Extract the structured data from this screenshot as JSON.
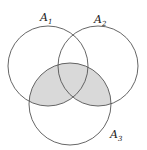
{
  "diagram": {
    "type": "venn",
    "sets": [
      {
        "name": "A",
        "sub": "1",
        "cx": 48,
        "cy": 66,
        "r": 40
      },
      {
        "name": "A",
        "sub": "2",
        "cx": 98,
        "cy": 66,
        "r": 40
      },
      {
        "name": "A",
        "sub": "3",
        "cx": 70,
        "cy": 104,
        "r": 41
      }
    ],
    "shaded_region": "A3 ∩ (A1 ∪ A2)",
    "colors": {
      "stroke": "#555555",
      "shade": "#d9d9d9"
    }
  }
}
